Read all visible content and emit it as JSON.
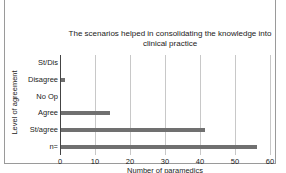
{
  "chart_data": {
    "type": "bar",
    "orientation": "horizontal",
    "title": "The scenarios helped in consolidating the knowledge into clinical practice",
    "title_lines": [
      "The scenarios helped in consolidating the knowledge into",
      "clinical practice"
    ],
    "xlabel": "Number of paramedics",
    "ylabel": "Level of agreement",
    "categories": [
      "St/Dis",
      "Disagree",
      "No Op",
      "Agree",
      "St/agree",
      "n="
    ],
    "values": [
      0,
      1,
      0,
      14,
      41,
      56
    ],
    "xlim": [
      0,
      60
    ],
    "xticks": [
      "0",
      "10",
      "20",
      "30",
      "40",
      "50",
      "60"
    ],
    "grid": true,
    "legend": null,
    "bar_color": "#707070"
  }
}
